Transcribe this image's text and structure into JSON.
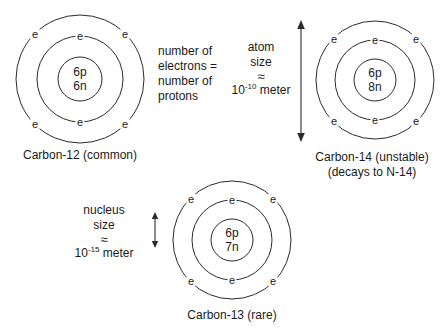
{
  "diagram": {
    "title_semantic": "carbon-isotopes-atomic-structure",
    "electron_symbol": "e"
  },
  "atoms": [
    {
      "id": "carbon-12",
      "nucleus_protons": "6p",
      "nucleus_neutrons": "6n",
      "caption": "Carbon-12 (common)",
      "electron_count": 6,
      "inner_shell_electrons": 2,
      "outer_shell_electrons": 4
    },
    {
      "id": "carbon-14",
      "nucleus_protons": "6p",
      "nucleus_neutrons": "8n",
      "caption_line1": "Carbon-14 (unstable)",
      "caption_line2": "(decays to N-14)",
      "electron_count": 6,
      "inner_shell_electrons": 2,
      "outer_shell_electrons": 4
    },
    {
      "id": "carbon-13",
      "nucleus_protons": "6p",
      "nucleus_neutrons": "7n",
      "caption": "Carbon-13 (rare)",
      "electron_count": 6,
      "inner_shell_electrons": 2,
      "outer_shell_electrons": 4
    }
  ],
  "notes": {
    "electron_proton_rule": {
      "line1": "number of",
      "line2": "electrons =",
      "line3": "number of",
      "line4": "protons"
    },
    "atom_size": {
      "line1": "atom",
      "line2": "size",
      "approx": "≈",
      "value_base": "10",
      "value_exponent": "-10",
      "unit": "meter"
    },
    "nucleus_size": {
      "line1": "nucleus",
      "line2": "size",
      "approx": "≈",
      "value_base": "10",
      "value_exponent": "-15",
      "unit": "meter"
    }
  },
  "colors": {
    "stroke": "#2b2b2b",
    "text": "#1a1a1a",
    "background": "#ffffff"
  }
}
